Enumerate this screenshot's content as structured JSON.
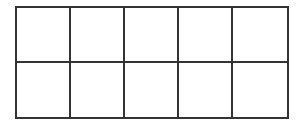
{
  "grid": {
    "rows": 2,
    "columns": 5,
    "line_color": "#333333",
    "background": "#ffffff",
    "cells": [
      [
        "",
        "",
        "",
        "",
        ""
      ],
      [
        "",
        "",
        "",
        "",
        ""
      ]
    ]
  }
}
